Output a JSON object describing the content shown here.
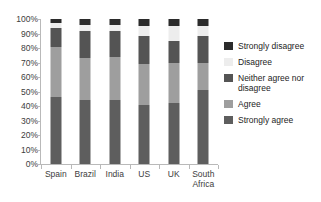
{
  "chart_data": {
    "type": "bar",
    "subtype": "stacked-percentage",
    "title": "",
    "xlabel": "",
    "ylabel": "",
    "ylim": [
      0,
      100
    ],
    "grid": false,
    "legend_position": "right",
    "categories": [
      "Spain",
      "Brazil",
      "India",
      "US",
      "UK",
      "South\nAfrica"
    ],
    "ytick_labels": [
      "100%",
      "90%",
      "80%",
      "70%",
      "60%",
      "50%",
      "40%",
      "30%",
      "20%",
      "10%",
      "0%"
    ],
    "ytick_values": [
      100,
      90,
      80,
      70,
      60,
      50,
      40,
      30,
      20,
      10,
      0
    ],
    "series": [
      {
        "name": "Strongly agree",
        "color": "#5e5e5e",
        "values": [
          46,
          44,
          44,
          41,
          42,
          51
        ]
      },
      {
        "name": "Agree",
        "color": "#9e9e9e",
        "values": [
          35,
          29,
          30,
          28,
          28,
          19
        ]
      },
      {
        "name": "Neither agree nor disagree",
        "color": "#545454",
        "values": [
          13,
          19,
          18,
          19,
          15,
          18
        ]
      },
      {
        "name": "Disagree",
        "color": "#ededed",
        "values": [
          3,
          4,
          4,
          7,
          10,
          7
        ]
      },
      {
        "name": "Strongly disagree",
        "color": "#2b2b2b",
        "values": [
          3,
          4,
          4,
          5,
          5,
          5
        ]
      }
    ],
    "legend_entries": [
      {
        "label": "Strongly disagree",
        "color": "#2b2b2b"
      },
      {
        "label": "Disagree",
        "color": "#ededed"
      },
      {
        "label": "Neither agree nor disagree",
        "color": "#545454"
      },
      {
        "label": "Agree",
        "color": "#9e9e9e"
      },
      {
        "label": "Strongly agree",
        "color": "#5e5e5e"
      }
    ]
  }
}
